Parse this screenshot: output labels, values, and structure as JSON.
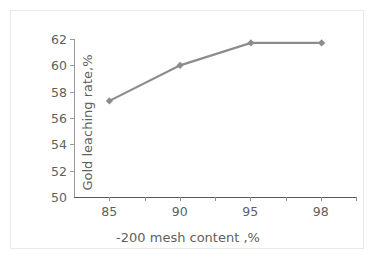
{
  "chart_data": {
    "type": "line",
    "title": "",
    "subtitle": "",
    "xlabel": "-200 mesh content ,%",
    "ylabel": "Gold leaching rate,%",
    "categories": [
      "85",
      "90",
      "95",
      "98"
    ],
    "values": [
      57.3,
      60.0,
      61.7,
      61.7
    ],
    "series": [
      {
        "name": "Gold leaching rate",
        "values": [
          57.3,
          60.0,
          61.7,
          61.7
        ],
        "color": "#8c8c8c",
        "marker": "diamond"
      }
    ],
    "ylim": [
      50,
      62
    ],
    "yticks": [
      50,
      52,
      54,
      56,
      58,
      60,
      62
    ],
    "ytick_labels": [
      "50",
      "52",
      "54",
      "56",
      "58",
      "60",
      "62"
    ],
    "xtick_labels": [
      "85",
      "90",
      "95",
      "98"
    ],
    "grid": false,
    "legend": false,
    "legend_position": "none",
    "annotations": [],
    "colors": {
      "series": "#8c8c8c",
      "axis": "#8f8f8f",
      "text": "#5f5f5f",
      "frame": "#e9e9e9",
      "background": "#ffffff"
    }
  }
}
